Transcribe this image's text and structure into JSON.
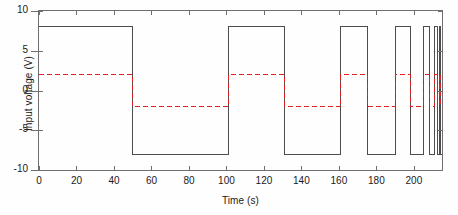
{
  "chart_data": {
    "type": "line",
    "title": "",
    "xlabel": "Time (s)",
    "ylabel": "Input voltage (V)",
    "xlim": [
      0,
      215
    ],
    "ylim": [
      -10,
      10
    ],
    "xticks": [
      0,
      20,
      40,
      60,
      80,
      100,
      120,
      140,
      160,
      180,
      200
    ],
    "yticks": [
      -10,
      -5,
      0,
      5,
      10
    ],
    "xticklabels": [
      "0",
      "20",
      "40",
      "60",
      "80",
      "100",
      "120",
      "140",
      "160",
      "180",
      "200"
    ],
    "yticklabels": [
      "-10",
      "-5",
      "0",
      "5",
      "10"
    ],
    "grid": false,
    "legend": "none",
    "series": [
      {
        "name": "Input voltage",
        "color": "#4d4d4d",
        "style": "solid",
        "linewidth": 1,
        "amplitude": 8,
        "high": 8,
        "low": -8,
        "edges": [
          0,
          50,
          101,
          131,
          161,
          175,
          190,
          198,
          205,
          208.5,
          211,
          212.5,
          213.7,
          214.4,
          215
        ],
        "start_level": 8
      },
      {
        "name": "Reference square wave",
        "color": "#e02020",
        "style": "dashed",
        "linewidth": 1,
        "amplitude": 2,
        "high": 2,
        "low": -2,
        "edges": [
          0,
          50,
          101,
          131,
          161,
          175,
          190,
          198,
          205,
          208.5,
          211,
          212.5,
          213.7,
          214.4,
          215
        ],
        "start_level": 2
      }
    ]
  },
  "axes": {
    "ylabel": "Input voltage (V)",
    "xlabel": "Time (s)",
    "ytick_labels": [
      "10",
      "5",
      "0",
      "-5",
      "-10"
    ],
    "xtick_labels": [
      "0",
      "20",
      "40",
      "60",
      "80",
      "100",
      "120",
      "140",
      "160",
      "180",
      "200"
    ]
  }
}
